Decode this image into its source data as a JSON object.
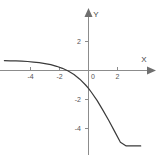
{
  "figure": {
    "background_color": "#ffffff",
    "axis_color": "#8c8c8c",
    "curve_color": "#3a3a3a",
    "tick_label_color": "#555555",
    "x_axis_label": "X",
    "y_axis_label": "Y"
  },
  "chart_data": {
    "type": "line",
    "title": "",
    "xlabel": "X",
    "ylabel": "Y",
    "xlim": [
      -5.8,
      5.2
    ],
    "ylim": [
      -5.2,
      3.1
    ],
    "grid": false,
    "legend": null,
    "x_ticks": [
      -4,
      -2,
      0,
      2
    ],
    "x_tick_labels": [
      "-4",
      "-2",
      "0",
      "2"
    ],
    "y_ticks": [
      2,
      -2,
      -4
    ],
    "y_tick_labels": [
      "2",
      "-2",
      "-4"
    ],
    "origin_label": "0",
    "axis_arrows": [
      "x-positive",
      "y-positive"
    ],
    "series": [
      {
        "name": "curve",
        "description": "decreasing exponential curve with horizontal asymptote near y = 0.7 as x decreases",
        "x": [
          -5.8,
          -5.4,
          -5.0,
          -4.6,
          -4.2,
          -3.8,
          -3.4,
          -3.0,
          -2.6,
          -2.2,
          -1.8,
          -1.4,
          -1.0,
          -0.6,
          -0.2,
          0.0,
          0.2,
          0.6,
          1.0,
          1.4,
          1.8,
          2.2,
          2.6,
          3.0,
          3.4,
          3.6
        ],
        "y": [
          0.68,
          0.67,
          0.66,
          0.64,
          0.62,
          0.58,
          0.54,
          0.48,
          0.4,
          0.29,
          0.15,
          -0.04,
          -0.28,
          -0.6,
          -1.0,
          -1.24,
          -1.5,
          -2.08,
          -2.75,
          -3.45,
          -4.2,
          -4.95,
          -5.2,
          -5.2,
          -5.2,
          -5.2
        ]
      }
    ]
  }
}
